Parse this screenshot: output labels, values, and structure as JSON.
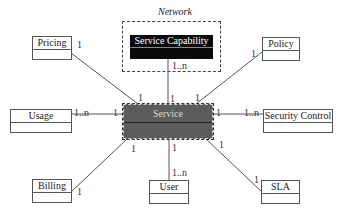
{
  "diagram": {
    "network": {
      "title": "Network"
    },
    "central": {
      "label": "Service"
    },
    "capability": {
      "label": "Service Capability",
      "multiplicity_capability": "1..n",
      "multiplicity_service": "1"
    },
    "entities": {
      "pricing": {
        "label": "Pricing",
        "mult_entity": "1",
        "mult_service": "1"
      },
      "policy": {
        "label": "Policy",
        "mult_entity": "1",
        "mult_service": "1"
      },
      "usage": {
        "label": "Usage",
        "mult_entity": "1..n",
        "mult_service": "1"
      },
      "security": {
        "label": "Security Control",
        "mult_entity": "1..n",
        "mult_service": "1"
      },
      "billing": {
        "label": "Billing",
        "mult_entity": "1",
        "mult_service": "1"
      },
      "user": {
        "label": "User",
        "mult_entity": "1..n",
        "mult_service": "1"
      },
      "sla": {
        "label": "SLA",
        "mult_entity": "1",
        "mult_service": "1"
      }
    },
    "colors": {
      "service_fill": "#5c5c5c",
      "capability_fill": "#0a0a0a",
      "line": "#555555"
    }
  }
}
